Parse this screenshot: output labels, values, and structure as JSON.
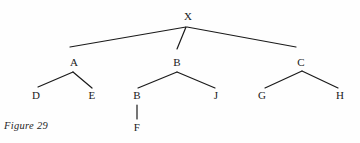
{
  "figure": {
    "caption": "Figure 29",
    "background_color": "#fefefe",
    "line_color": "#1a1a1a",
    "text_color": "#1a1a1a"
  },
  "diagram": {
    "type": "tree",
    "nodes": [
      {
        "id": "x",
        "label": "X",
        "x": 188,
        "y": 16,
        "level": 0
      },
      {
        "id": "a",
        "label": "A",
        "x": 74,
        "y": 62,
        "level": 1
      },
      {
        "id": "b",
        "label": "B",
        "x": 177,
        "y": 62,
        "level": 1
      },
      {
        "id": "c",
        "label": "C",
        "x": 301,
        "y": 62,
        "level": 1
      },
      {
        "id": "d",
        "label": "D",
        "x": 36,
        "y": 95,
        "level": 2
      },
      {
        "id": "e",
        "label": "E",
        "x": 92,
        "y": 95,
        "level": 2
      },
      {
        "id": "b2",
        "label": "B",
        "x": 137,
        "y": 95,
        "level": 2
      },
      {
        "id": "j",
        "label": "J",
        "x": 216,
        "y": 95,
        "level": 2
      },
      {
        "id": "g",
        "label": "G",
        "x": 262,
        "y": 95,
        "level": 2
      },
      {
        "id": "h",
        "label": "H",
        "x": 340,
        "y": 95,
        "level": 2
      },
      {
        "id": "f",
        "label": "F",
        "x": 137,
        "y": 127,
        "level": 3
      }
    ],
    "edges": [
      {
        "id": "x-a",
        "from": "x",
        "to": "a",
        "x1": 186,
        "y1": 27,
        "x2": 70,
        "y2": 47
      },
      {
        "id": "x-b",
        "from": "x",
        "to": "b",
        "x1": 186,
        "y1": 27,
        "x2": 177,
        "y2": 49
      },
      {
        "id": "x-c",
        "from": "x",
        "to": "c",
        "x1": 187,
        "y1": 27,
        "x2": 296,
        "y2": 47
      },
      {
        "id": "a-d",
        "from": "a",
        "to": "d",
        "x1": 73,
        "y1": 72,
        "x2": 38,
        "y2": 87
      },
      {
        "id": "a-e",
        "from": "a",
        "to": "e",
        "x1": 73,
        "y1": 72,
        "x2": 92,
        "y2": 88
      },
      {
        "id": "b-b2",
        "from": "b",
        "to": "b2",
        "x1": 177,
        "y1": 72,
        "x2": 138,
        "y2": 88
      },
      {
        "id": "b-j",
        "from": "b",
        "to": "j",
        "x1": 177,
        "y1": 72,
        "x2": 215,
        "y2": 88
      },
      {
        "id": "b2-f",
        "from": "b2",
        "to": "f",
        "x1": 137,
        "y1": 105,
        "x2": 137,
        "y2": 119
      },
      {
        "id": "c-g",
        "from": "c",
        "to": "g",
        "x1": 302,
        "y1": 71,
        "x2": 265,
        "y2": 88
      },
      {
        "id": "c-h",
        "from": "c",
        "to": "h",
        "x1": 302,
        "y1": 71,
        "x2": 338,
        "y2": 88
      }
    ]
  }
}
